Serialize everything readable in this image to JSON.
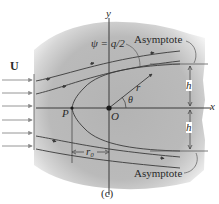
{
  "figure": {
    "caption": "(c)",
    "labels": {
      "U": "U",
      "y_axis": "y",
      "x_axis": "x",
      "psi": "ψ = q/2",
      "asymptote_top": "Asymptote",
      "asymptote_bottom": "Asymptote",
      "r": "r",
      "theta": "θ",
      "origin": "O",
      "stagnation": "P",
      "h_top": "h",
      "h_bottom": "h",
      "r0": "r₀"
    },
    "colors": {
      "shade": "#b9b9b9",
      "line": "#3a3a3a",
      "arrow": "#8a8a8a"
    }
  }
}
